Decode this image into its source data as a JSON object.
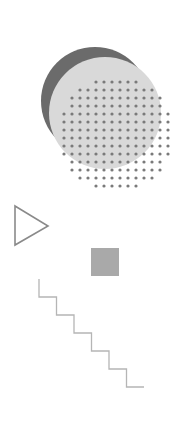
{
  "canvas": {
    "width": 194,
    "height": 425,
    "background": "#ffffff"
  },
  "shapes": {
    "dark_circle": {
      "cx": 95,
      "cy": 101,
      "r": 54,
      "color": "#6b6b6b"
    },
    "light_circle": {
      "cx": 105,
      "cy": 113,
      "r": 56,
      "color": "#d9d9d9"
    },
    "dot_grid": {
      "cx": 116,
      "cy": 134,
      "r": 60,
      "spacing": 8,
      "dot_r": 1.6,
      "color": "#7a7a7a"
    },
    "triangle": {
      "points": "15,206 48,226 15,245",
      "stroke": "#8a8a8a",
      "stroke_width": 1.6
    },
    "square": {
      "x": 91,
      "y": 248,
      "size": 28,
      "color": "#a9a9a9"
    },
    "stairs": {
      "start_x": 39,
      "start_y": 279,
      "step_w": 17.5,
      "step_h": 18,
      "steps": 6,
      "stroke": "#b5b5b5",
      "stroke_width": 1.3
    }
  }
}
